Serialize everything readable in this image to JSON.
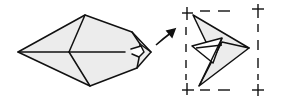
{
  "diagram": {
    "type": "origami-fold-step",
    "colors": {
      "stroke": "#111111",
      "fill": "#ececec",
      "background": "#ffffff"
    },
    "left_figure": {
      "label": "",
      "description": "diamond-shaped folded paper with small tip fold on right"
    },
    "arrow": {
      "description": "curved arrow pointing to result"
    },
    "right_figure": {
      "label": "",
      "description": "folded bird/crane shape within dashed crop frame with corner cross marks"
    }
  }
}
